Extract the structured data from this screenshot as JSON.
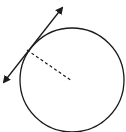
{
  "diagram": {
    "stroke_color": "#1a1a1a",
    "background": "#ffffff",
    "circle": {
      "cx": 72,
      "cy": 80,
      "r": 52
    },
    "tangent_line": {
      "x1": 2,
      "y1": 85,
      "x2": 65,
      "y2": 5,
      "arrows": "both"
    },
    "radius": {
      "x1": 27,
      "y1": 50,
      "x2": 72,
      "y2": 81,
      "style": "dashed"
    },
    "tangent_point": {
      "x": 27,
      "y": 50
    }
  }
}
